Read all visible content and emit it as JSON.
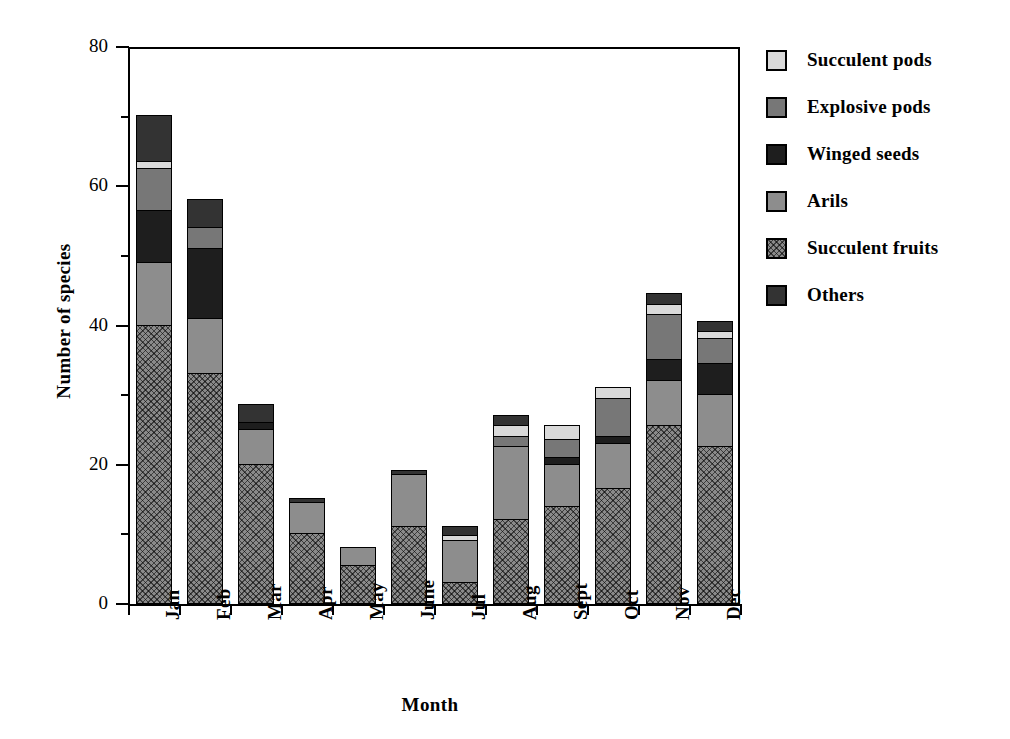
{
  "chart_data": {
    "type": "bar",
    "subtype": "stacked-vertical",
    "title": "",
    "xlabel": "Month",
    "ylabel": "Number of species",
    "ylim": [
      0,
      80
    ],
    "ytick_major": [
      0,
      20,
      40,
      60,
      80
    ],
    "ytick_minor": [
      10,
      30,
      50,
      70
    ],
    "ytick_labels": [
      "0",
      "20",
      "40",
      "60",
      "80"
    ],
    "grid": false,
    "legend_position": "right",
    "categories": [
      "Jan",
      "Feb",
      "Mar",
      "Apr",
      "May",
      "June",
      "Jul",
      "Aug",
      "Sept",
      "Oct",
      "Nov",
      "Dec"
    ],
    "series": [
      {
        "name": "Succulent fruits",
        "color": "#8a8a8a",
        "pattern": "crosshatch",
        "values": [
          40,
          33,
          20,
          10,
          5.5,
          11,
          3,
          12,
          14,
          16.5,
          25.5,
          22.5
        ]
      },
      {
        "name": "Arils",
        "color": "#8d8d8d",
        "pattern": "solid",
        "values": [
          9,
          8,
          5,
          4.5,
          2.5,
          7.5,
          6,
          10.5,
          6,
          6.5,
          6.5,
          7.5
        ]
      },
      {
        "name": "Winged seeds",
        "color": "#1e1e1e",
        "pattern": "solid",
        "values": [
          7.5,
          10,
          1,
          0,
          0,
          0,
          0,
          0,
          1,
          1,
          3,
          4.5
        ]
      },
      {
        "name": "Explosive pods",
        "color": "#777777",
        "pattern": "solid",
        "values": [
          6,
          3,
          0,
          0,
          0,
          0,
          0,
          1.5,
          2.5,
          5.5,
          6.5,
          3.5
        ]
      },
      {
        "name": "Succulent pods",
        "color": "#d9d9d9",
        "pattern": "solid",
        "values": [
          1,
          0,
          0,
          0,
          0,
          0,
          0.8,
          1.5,
          2,
          1.5,
          1.5,
          1
        ]
      },
      {
        "name": "Others",
        "color": "#333333",
        "pattern": "solid",
        "values": [
          6.5,
          4,
          2.5,
          0.5,
          0,
          0.5,
          1.2,
          1.5,
          0,
          0,
          1.5,
          1.5
        ]
      }
    ],
    "totals": [
      70,
      58,
      29.5,
      15,
      8,
      19,
      11,
      27,
      26,
      31,
      44.5,
      40.5
    ],
    "legend_order": [
      "Succulent pods",
      "Explosive pods",
      "Winged seeds",
      "Arils",
      "Succulent fruits",
      "Others"
    ]
  },
  "legend": {
    "items": [
      {
        "label": "Succulent pods",
        "fill_class": "fill-succulent-pods"
      },
      {
        "label": "Explosive pods",
        "fill_class": "fill-explosive-pods"
      },
      {
        "label": "Winged seeds",
        "fill_class": "fill-winged-seeds"
      },
      {
        "label": "Arils",
        "fill_class": "fill-arils"
      },
      {
        "label": "Succulent fruits",
        "fill_class": "fill-succulent-fruits"
      },
      {
        "label": "Others",
        "fill_class": "fill-others"
      }
    ]
  }
}
